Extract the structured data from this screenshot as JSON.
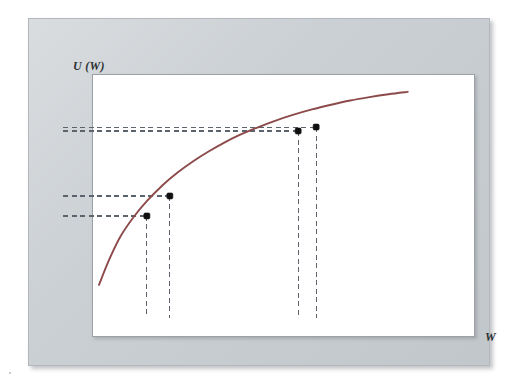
{
  "figure": {
    "y_axis_label": "U (W)",
    "x_axis_label": "W",
    "curve_color": "#8c4a4a",
    "point_color": "#111111",
    "dash_color": "#5b646c",
    "panel_color": "#c9ced2",
    "plot_background": "#ffffff"
  },
  "chart_data": {
    "type": "line",
    "title": "",
    "xlabel": "W",
    "ylabel": "U (W)",
    "grid": false,
    "legend": null,
    "xlim": [
      0,
      100
    ],
    "ylim": [
      0,
      100
    ],
    "series": [
      {
        "name": "U(W)",
        "color": "#8c4a4a",
        "x": [
          9.4,
          12.0,
          15.0,
          18.5,
          22.0,
          26.0,
          30.0,
          34.0,
          38.0,
          42.0,
          46.0,
          50.0,
          55.0,
          60.0,
          65.0,
          70.0,
          75.0,
          80.0,
          85.0,
          90.0
        ],
        "y": [
          12.6,
          22.0,
          31.0,
          38.5,
          44.6,
          50.5,
          55.4,
          59.6,
          63.3,
          66.6,
          69.5,
          72.0,
          74.8,
          77.2,
          79.3,
          81.1,
          82.7,
          84.0,
          85.1,
          86.0
        ]
      }
    ],
    "points": [
      {
        "label": "P1",
        "x": 21.9,
        "y": 38.8
      },
      {
        "label": "P2",
        "x": 27.9,
        "y": 46.4
      },
      {
        "label": "P3",
        "x": 61.4,
        "y": 71.1
      },
      {
        "label": "P4",
        "x": 66.1,
        "y": 72.6
      }
    ],
    "projection_lines": {
      "horizontal_y": [
        38.8,
        46.4,
        71.1,
        72.6
      ],
      "vertical_x": [
        21.9,
        27.9,
        61.4,
        66.1
      ],
      "style": "dashed"
    },
    "annotations": [
      "Concave (risk-averse) utility function U(W) of wealth W",
      "Four marked points projected to both axes with dashed lines"
    ]
  }
}
